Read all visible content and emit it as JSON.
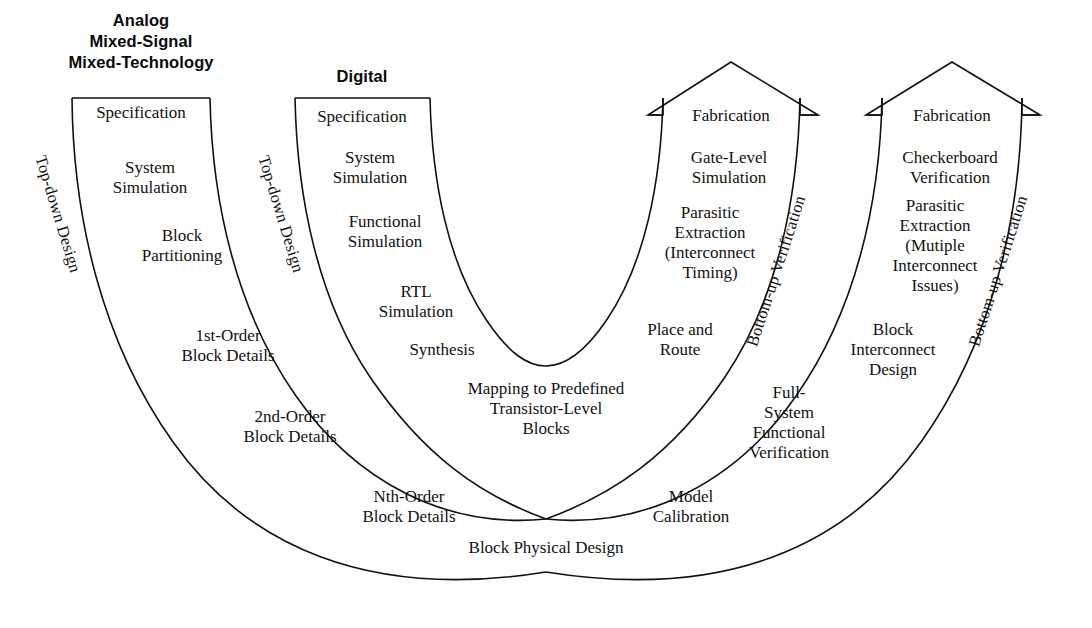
{
  "figure": {
    "title_semantic": "design-flow-u-diagram",
    "background": "#ffffff",
    "line_color": "#111111"
  },
  "headers": [
    {
      "id": "analog",
      "lines": "Analog\nMixed-Signal\nMixed-Technology"
    },
    {
      "id": "digital",
      "lines": "Digital"
    }
  ],
  "side_labels": [
    {
      "id": "topdown-analog",
      "text": "Top-down Design"
    },
    {
      "id": "topdown-digital",
      "text": "Top-down Design"
    },
    {
      "id": "bottomup-1",
      "text": "Bottom-up Verification"
    },
    {
      "id": "bottomup-2",
      "text": "Bottom-up Verification"
    }
  ],
  "bands": [
    {
      "id": "analog-top-down",
      "arrowhead": false,
      "steps": [
        "Specification",
        "System\nSimulation",
        "Block\nPartitioning",
        "1st-Order\nBlock Details",
        "2nd-Order\nBlock Details",
        "Nth-Order\nBlock Details",
        "Block Physical Design"
      ]
    },
    {
      "id": "digital-top-down",
      "arrowhead": false,
      "steps": [
        "Specification",
        "System\nSimulation",
        "Functional\nSimulation",
        "RTL\nSimulation",
        "Synthesis",
        "Mapping to Predefined\nTransistor-Level\nBlocks"
      ]
    },
    {
      "id": "digital-bottom-up",
      "arrowhead": true,
      "steps": [
        "Fabrication",
        "Gate-Level\nSimulation",
        "Parasitic\nExtraction\n(Interconnect\nTiming)",
        "Place and\nRoute",
        "Model\nCalibration"
      ]
    },
    {
      "id": "analog-bottom-up",
      "arrowhead": true,
      "steps": [
        "Fabrication",
        "Checkerboard\nVerification",
        "Parasitic\nExtraction\n(Mutiple\nInterconnect\nIssues)",
        "Block\nInterconnect\nDesign",
        "Full-\nSystem\nFunctional\nVerification"
      ]
    }
  ],
  "steps_positioned": [
    {
      "id": "a-specification",
      "text": "Specification",
      "x": 141,
      "y": 114
    },
    {
      "id": "a-system-simulation",
      "text": "System\nSimulation",
      "x": 150,
      "y": 179
    },
    {
      "id": "a-block-partitioning",
      "text": "Block\nPartitioning",
      "x": 182,
      "y": 247
    },
    {
      "id": "a-1st-order",
      "text": "1st-Order\nBlock Details",
      "x": 228,
      "y": 347
    },
    {
      "id": "a-2nd-order",
      "text": "2nd-Order\nBlock Details",
      "x": 290,
      "y": 428
    },
    {
      "id": "a-nth-order",
      "text": "Nth-Order\nBlock Details",
      "x": 409,
      "y": 508
    },
    {
      "id": "a-block-physical",
      "text": "Block Physical Design",
      "x": 546,
      "y": 549
    },
    {
      "id": "d-specification",
      "text": "Specification",
      "x": 362,
      "y": 118
    },
    {
      "id": "d-system-simulation",
      "text": "System\nSimulation",
      "x": 370,
      "y": 169
    },
    {
      "id": "d-functional-simulation",
      "text": "Functional\nSimulation",
      "x": 385,
      "y": 233
    },
    {
      "id": "d-rtl-simulation",
      "text": "RTL\nSimulation",
      "x": 416,
      "y": 303
    },
    {
      "id": "d-synthesis",
      "text": "Synthesis",
      "x": 442,
      "y": 351
    },
    {
      "id": "d-mapping",
      "text": "Mapping to Predefined\nTransistor-Level\nBlocks",
      "x": 546,
      "y": 411
    },
    {
      "id": "f1-fabrication",
      "text": "Fabrication",
      "x": 731,
      "y": 117
    },
    {
      "id": "f1-gate-level",
      "text": "Gate-Level\nSimulation",
      "x": 729,
      "y": 169
    },
    {
      "id": "f1-parasitic",
      "text": "Parasitic\nExtraction\n(Interconnect\nTiming)",
      "x": 710,
      "y": 256
    },
    {
      "id": "f1-place-route",
      "text": "Place and\nRoute",
      "x": 680,
      "y": 341
    },
    {
      "id": "f1-model-calibration",
      "text": "Model\nCalibration",
      "x": 691,
      "y": 508
    },
    {
      "id": "f2-fabrication",
      "text": "Fabrication",
      "x": 952,
      "y": 117
    },
    {
      "id": "f2-checkerboard",
      "text": "Checkerboard\nVerification",
      "x": 950,
      "y": 169
    },
    {
      "id": "f2-parasitic",
      "text": "Parasitic\nExtraction\n(Mutiple\nInterconnect\nIssues)",
      "x": 935,
      "y": 260
    },
    {
      "id": "f2-block-interconnect",
      "text": "Block\nInterconnect\nDesign",
      "x": 893,
      "y": 352
    },
    {
      "id": "f2-full-system",
      "text": "Full-\nSystem\nFunctional\nVerification",
      "x": 789,
      "y": 425
    }
  ],
  "rotated_labels": [
    {
      "id": "topdown-analog",
      "text": "Top-down Design",
      "x": 45,
      "y": 150,
      "rot": 73
    },
    {
      "id": "topdown-digital",
      "text": "Top-down Design",
      "x": 268,
      "y": 150,
      "rot": 73
    },
    {
      "id": "bottomup-1",
      "text": "Bottom-up Verification",
      "x": 757,
      "y": 332,
      "rot": -72
    },
    {
      "id": "bottomup-2",
      "text": "Bottom-up Verification",
      "x": 979,
      "y": 332,
      "rot": -72
    }
  ],
  "header_positions": [
    {
      "id": "analog",
      "x": 141,
      "y": 10
    },
    {
      "id": "digital",
      "x": 362,
      "y": 66
    }
  ],
  "geometry": {
    "center_x": 546,
    "center_y": 96,
    "top_y": 98,
    "bottom_outer_y": 572,
    "arrow_tip_y": 62
  }
}
